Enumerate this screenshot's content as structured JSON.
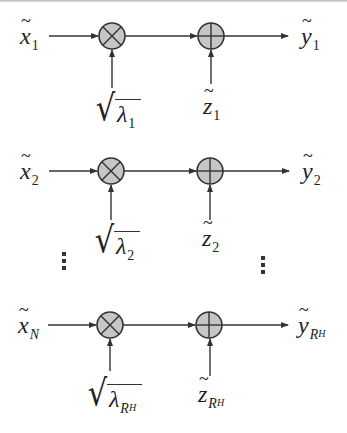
{
  "diagram": {
    "title": "",
    "colors": {
      "line": "#333333",
      "node_fill": "#c6c6c6",
      "node_stroke": "#333333",
      "background": "#ffffff"
    },
    "nodes_legend": {
      "multiplier": "multiplier (⊗)",
      "adder": "adder (⊕)"
    },
    "rows": [
      {
        "input": {
          "symbol": "x",
          "tilde": "~",
          "sub": "1",
          "sub_italic": false,
          "subsub": ""
        },
        "gain": {
          "symbol": "λ",
          "sub": "1",
          "sub_italic": false,
          "subsub": ""
        },
        "noise": {
          "symbol": "z",
          "tilde": "~",
          "sub": "1",
          "sub_italic": false,
          "subsub": ""
        },
        "output": {
          "symbol": "y",
          "tilde": "~",
          "sub": "1",
          "sub_italic": false,
          "subsub": ""
        }
      },
      {
        "input": {
          "symbol": "x",
          "tilde": "~",
          "sub": "2",
          "sub_italic": false,
          "subsub": ""
        },
        "gain": {
          "symbol": "λ",
          "sub": "2",
          "sub_italic": false,
          "subsub": ""
        },
        "noise": {
          "symbol": "z",
          "tilde": "~",
          "sub": "2",
          "sub_italic": false,
          "subsub": ""
        },
        "output": {
          "symbol": "y",
          "tilde": "~",
          "sub": "2",
          "sub_italic": false,
          "subsub": ""
        }
      },
      {
        "input": {
          "symbol": "x",
          "tilde": "~",
          "sub": "N",
          "sub_italic": true,
          "subsub": ""
        },
        "gain": {
          "symbol": "λ",
          "sub": "R",
          "sub_italic": true,
          "subsub": "H"
        },
        "noise": {
          "symbol": "z",
          "tilde": "~",
          "sub": "R",
          "sub_italic": true,
          "subsub": "H"
        },
        "output": {
          "symbol": "y",
          "tilde": "~",
          "sub": "R",
          "sub_italic": true,
          "subsub": "H"
        }
      }
    ],
    "ellipsis": {
      "left": "⋮",
      "right": "⋮"
    }
  }
}
